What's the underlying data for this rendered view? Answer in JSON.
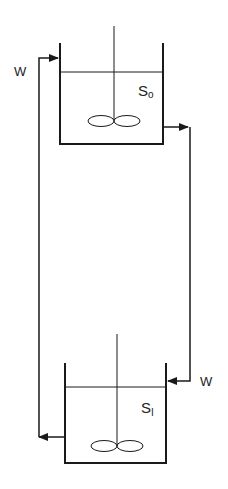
{
  "diagram": {
    "type": "two-tank recycle flow",
    "tanks": [
      {
        "id": "upper",
        "label": "S",
        "subscript": "o"
      },
      {
        "id": "lower",
        "label": "S",
        "subscript": "1"
      }
    ],
    "flows": [
      {
        "label": "W",
        "from": "lower",
        "to": "upper",
        "side": "left"
      },
      {
        "label": "W",
        "from": "upper",
        "to": "lower",
        "side": "right"
      }
    ]
  },
  "labels": {
    "flow_left": "W",
    "flow_right": "W",
    "tank_upper_main": "S",
    "tank_upper_sub": "o",
    "tank_lower_main": "S",
    "tank_lower_sub": "I"
  },
  "colors": {
    "line": "#1a1a1a",
    "background": "#ffffff"
  }
}
